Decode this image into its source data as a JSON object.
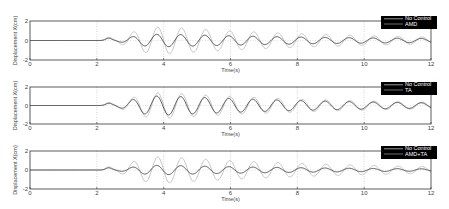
{
  "chart_data": [
    {
      "type": "line",
      "title": "",
      "xlabel": "Time(s)",
      "ylabel": "Displacement X(cm)",
      "xlim": [
        0,
        12
      ],
      "ylim": [
        -2,
        2
      ],
      "xticks": [
        0,
        2,
        4,
        6,
        8,
        10,
        12
      ],
      "yticks": [
        -2,
        0,
        2
      ],
      "grid": "dotted vertical at x ticks, dotted horizontal at y=0",
      "legend": {
        "position": "upper right",
        "background": "#000000",
        "entries": [
          "No Control",
          "AMD"
        ]
      },
      "series": [
        {
          "name": "No Control",
          "color": "#bdbdbd",
          "peak_amplitude": 1.4,
          "onset_time": 2.2,
          "peak_time": 4.0,
          "period": 0.72,
          "amplitude_at_12s": 0.35
        },
        {
          "name": "AMD",
          "color": "#333333",
          "peak_amplitude": 0.65,
          "onset_time": 2.2,
          "peak_time": 4.0,
          "period": 0.72,
          "amplitude_at_12s": 0.2
        }
      ]
    },
    {
      "type": "line",
      "title": "",
      "xlabel": "Time(s)",
      "ylabel": "Displacement X(cm)",
      "xlim": [
        0,
        12
      ],
      "ylim": [
        -2,
        2
      ],
      "xticks": [
        0,
        2,
        4,
        6,
        8,
        10,
        12
      ],
      "yticks": [
        -2,
        0,
        2
      ],
      "grid": "dotted vertical at x ticks, dotted horizontal at y=0",
      "legend": {
        "position": "upper right",
        "background": "#000000",
        "entries": [
          "No Control",
          "TA"
        ]
      },
      "series": [
        {
          "name": "No Control",
          "color": "#bdbdbd",
          "peak_amplitude": 1.4,
          "onset_time": 2.2,
          "peak_time": 4.0,
          "period": 0.72,
          "amplitude_at_12s": 0.35
        },
        {
          "name": "TA",
          "color": "#333333",
          "peak_amplitude": 1.05,
          "onset_time": 2.2,
          "peak_time": 4.0,
          "period": 0.72,
          "amplitude_at_12s": 0.28
        }
      ]
    },
    {
      "type": "line",
      "title": "",
      "xlabel": "Time(s)",
      "ylabel": "Displacement X(cm)",
      "xlim": [
        0,
        12
      ],
      "ylim": [
        -2,
        2
      ],
      "xticks": [
        0,
        2,
        4,
        6,
        8,
        10,
        12
      ],
      "yticks": [
        -2,
        0,
        2
      ],
      "grid": "dotted vertical at x ticks, dotted horizontal at y=0",
      "legend": {
        "position": "upper right",
        "background": "#000000",
        "entries": [
          "No Control",
          "AMD+TA"
        ]
      },
      "series": [
        {
          "name": "No Control",
          "color": "#bdbdbd",
          "peak_amplitude": 1.4,
          "onset_time": 2.2,
          "peak_time": 4.0,
          "period": 0.72,
          "amplitude_at_12s": 0.35
        },
        {
          "name": "AMD+TA",
          "color": "#333333",
          "peak_amplitude": 0.5,
          "onset_time": 2.2,
          "peak_time": 4.0,
          "period": 0.72,
          "amplitude_at_12s": 0.12
        }
      ]
    }
  ],
  "layout": {
    "plot_left": 30,
    "plot_right": 431,
    "panels": [
      {
        "top": 21,
        "bottom": 60
      },
      {
        "top": 87,
        "bottom": 124
      },
      {
        "top": 151,
        "bottom": 189
      }
    ]
  }
}
